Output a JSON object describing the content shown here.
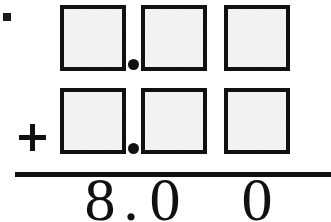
{
  "worksheet": {
    "type": "decimal-addition-problem",
    "operator": "+",
    "decimal_point": ".",
    "rows": [
      {
        "name": "addend-row-1",
        "boxes": [
          {
            "label": "",
            "place": "ones"
          },
          {
            "label": "",
            "place": "tenths"
          },
          {
            "label": "",
            "place": "hundredths"
          }
        ]
      },
      {
        "name": "addend-row-2",
        "boxes": [
          {
            "label": "",
            "place": "ones"
          },
          {
            "label": "",
            "place": "tenths"
          },
          {
            "label": "",
            "place": "hundredths"
          }
        ]
      }
    ],
    "answer": {
      "ones": "8",
      "point": ".",
      "tenths": "0",
      "hundredths": "0",
      "full_text": "8.00"
    },
    "colors": {
      "ink": "#111111",
      "box_fill": "#ececec",
      "page": "#ffffff"
    }
  }
}
